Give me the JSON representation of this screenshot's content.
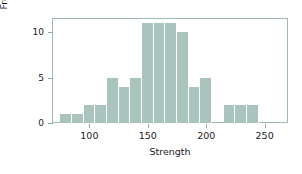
{
  "chart_data": {
    "type": "bar",
    "title": "",
    "subtitle": "",
    "xlabel": "Strength",
    "ylabel": "Frequency",
    "xlim": [
      68,
      270
    ],
    "ylim": [
      0,
      11.6
    ],
    "grid": false,
    "legend": null,
    "bin_width": 10,
    "bin_starts": [
      75,
      85,
      95,
      105,
      115,
      125,
      135,
      145,
      155,
      165,
      175,
      185,
      195,
      205,
      215,
      225,
      235
    ],
    "categories": [
      "75-85",
      "85-95",
      "95-105",
      "105-115",
      "115-125",
      "125-135",
      "135-145",
      "145-155",
      "155-165",
      "165-175",
      "175-185",
      "185-195",
      "195-205",
      "205-215",
      "215-225",
      "225-235",
      "235-245"
    ],
    "values": [
      1,
      1,
      2,
      2,
      5,
      4,
      5,
      11,
      11,
      11,
      10,
      4,
      5,
      0,
      2,
      2,
      2
    ],
    "bar_color": "#a9c4bd",
    "xticks": [
      100,
      150,
      200,
      250
    ],
    "xtick_labels": [
      "100",
      "150",
      "200",
      "250"
    ],
    "yticks": [
      0,
      5,
      10
    ],
    "ytick_labels": [
      "0",
      "5",
      "10"
    ]
  },
  "figure": {
    "background": "#ffffff",
    "frame_color": "#9fb8b2"
  }
}
